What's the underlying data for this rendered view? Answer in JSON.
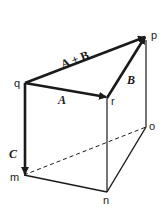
{
  "diagram": {
    "type": "vector-addition-prism",
    "vertices": {
      "q": {
        "label": "q",
        "x": 25,
        "y": 83
      },
      "p": {
        "label": "p",
        "x": 146,
        "y": 36
      },
      "r": {
        "label": "r",
        "x": 107,
        "y": 98
      },
      "m": {
        "label": "m",
        "x": 24,
        "y": 175
      },
      "n": {
        "label": "n",
        "x": 107,
        "y": 192
      },
      "o": {
        "label": "o",
        "x": 146,
        "y": 127
      }
    },
    "vectors": [
      {
        "id": "A",
        "label": "A",
        "from": "q",
        "to": "r"
      },
      {
        "id": "B",
        "label": "B",
        "from": "r",
        "to": "p"
      },
      {
        "id": "AB",
        "label": "A + B",
        "from": "q",
        "to": "p"
      },
      {
        "id": "C",
        "label": "C",
        "from": "q",
        "to": "m"
      }
    ],
    "edges_solid": [
      [
        "r",
        "n"
      ],
      [
        "p",
        "o"
      ],
      [
        "m",
        "n"
      ],
      [
        "n",
        "o"
      ]
    ],
    "edges_dashed": [
      [
        "m",
        "o"
      ]
    ],
    "colors": {
      "line": "#1a1a1a",
      "background": "#ffffff"
    }
  },
  "labels": {
    "q": "q",
    "p": "p",
    "r": "r",
    "m": "m",
    "n": "n",
    "o": "o",
    "A": "A",
    "B": "B",
    "AB": "A + B",
    "C": "C"
  }
}
